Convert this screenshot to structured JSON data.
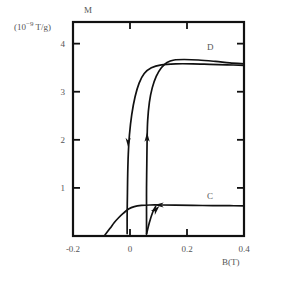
{
  "chart_data": {
    "type": "line",
    "title": "",
    "xlabel": "B(T)",
    "ylabel": "M",
    "ylabel_units": "(10^-9 T/g)",
    "xlim": [
      -0.2,
      0.4
    ],
    "ylim": [
      0,
      4.45
    ],
    "grid": false,
    "legend": false,
    "xticks": [
      -0.2,
      0,
      0.2,
      0.4
    ],
    "xticklabels": [
      "-0.2",
      "0",
      "0.2",
      "0.4"
    ],
    "yticks": [
      1,
      2,
      3,
      4
    ],
    "yticklabels": [
      "1",
      "2",
      "3",
      "4"
    ],
    "annotations": [
      {
        "text": "D",
        "x": 0.29,
        "y": 3.92,
        "note": "upper saturation branch label"
      },
      {
        "text": "C",
        "x": 0.29,
        "y": 0.79,
        "note": "lower branch label"
      }
    ],
    "series": [
      {
        "name": "upper-saturation-branch-descending",
        "comment": "comes in from right at saturation ~3.55, bends down near B~0.02 and drops to baseline",
        "points": [
          [
            0.4,
            3.55
          ],
          [
            0.34,
            3.56
          ],
          [
            0.28,
            3.57
          ],
          [
            0.22,
            3.58
          ],
          [
            0.16,
            3.58
          ],
          [
            0.11,
            3.56
          ],
          [
            0.075,
            3.5
          ],
          [
            0.05,
            3.38
          ],
          [
            0.032,
            3.18
          ],
          [
            0.018,
            2.9
          ],
          [
            0.006,
            2.52
          ],
          [
            -0.002,
            2.1
          ],
          [
            -0.006,
            1.7
          ],
          [
            -0.008,
            1.3
          ],
          [
            -0.009,
            0.9
          ],
          [
            -0.01,
            0.45
          ],
          [
            -0.01,
            0.05
          ]
        ]
      },
      {
        "name": "upper-saturation-branch-ascending",
        "comment": "rises from baseline near B~0.06 up to saturation ~3.65 then flattens to right edge",
        "points": [
          [
            0.058,
            0.05
          ],
          [
            0.058,
            0.5
          ],
          [
            0.058,
            1.0
          ],
          [
            0.059,
            1.5
          ],
          [
            0.06,
            2.0
          ],
          [
            0.062,
            2.4
          ],
          [
            0.068,
            2.78
          ],
          [
            0.078,
            3.08
          ],
          [
            0.092,
            3.32
          ],
          [
            0.11,
            3.5
          ],
          [
            0.13,
            3.61
          ],
          [
            0.155,
            3.66
          ],
          [
            0.19,
            3.67
          ],
          [
            0.24,
            3.66
          ],
          [
            0.3,
            3.63
          ],
          [
            0.35,
            3.6
          ],
          [
            0.4,
            3.58
          ]
        ]
      },
      {
        "name": "lower-minor-loop-branch",
        "comment": "low arc rising from baseline near B=-0.09, peaking ~0.63 then flat to right edge",
        "points": [
          [
            -0.088,
            0.02
          ],
          [
            -0.07,
            0.16
          ],
          [
            -0.055,
            0.28
          ],
          [
            -0.04,
            0.38
          ],
          [
            -0.022,
            0.48
          ],
          [
            -0.005,
            0.56
          ],
          [
            0.015,
            0.61
          ],
          [
            0.04,
            0.635
          ],
          [
            0.07,
            0.645
          ],
          [
            0.11,
            0.645
          ],
          [
            0.16,
            0.64
          ],
          [
            0.22,
            0.636
          ],
          [
            0.29,
            0.632
          ],
          [
            0.35,
            0.63
          ],
          [
            0.4,
            0.628
          ]
        ]
      },
      {
        "name": "lower-return-segment",
        "comment": "short up-slanting segment from baseline to the flat lower branch",
        "points": [
          [
            0.058,
            0.04
          ],
          [
            0.068,
            0.28
          ],
          [
            0.08,
            0.5
          ],
          [
            0.09,
            0.61
          ]
        ]
      }
    ],
    "arrows": [
      {
        "name": "down-arrow-descending-branch",
        "x": -0.0065,
        "y": 1.98,
        "direction": "down"
      },
      {
        "name": "up-arrow-ascending-branch",
        "x": 0.06,
        "y": 2.02,
        "direction": "up"
      },
      {
        "name": "left-arrow-lower-branch",
        "x": 0.108,
        "y": 0.645,
        "direction": "left"
      },
      {
        "name": "up-right-arrow-lower-branch",
        "x": 0.086,
        "y": 0.52,
        "direction": "up-right"
      }
    ]
  }
}
